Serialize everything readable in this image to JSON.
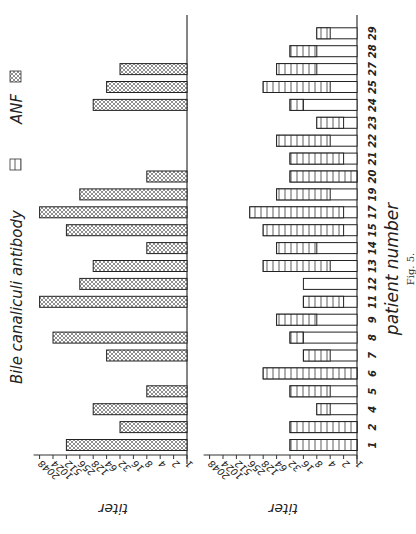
{
  "figure": {
    "caption": "Fig. 5.",
    "orientation": "rotated -90deg",
    "legend": [
      {
        "label": "Bile canaliculi antibody",
        "pattern": "vertical-stripes"
      },
      {
        "label": "ANF",
        "pattern": "cross-hatch"
      }
    ],
    "colors": {
      "ink": "#222222",
      "background": "#ffffff"
    }
  },
  "chart_data": [
    {
      "type": "bar",
      "title": "ANF",
      "xlabel": "patient number",
      "ylabel": "titer",
      "yscale": "log2",
      "ytick_labels": [
        "1",
        "2",
        "4",
        "8",
        "16",
        "32",
        "64",
        "128",
        "256",
        "512",
        "1024",
        "2048"
      ],
      "ylim": [
        1,
        2048
      ],
      "categories": [
        "1",
        "2",
        "4",
        "5",
        "6",
        "7",
        "8",
        "9",
        "11",
        "12",
        "13",
        "14",
        "15",
        "17",
        "19",
        "20",
        "21",
        "22",
        "23",
        "24",
        "25",
        "27",
        "28",
        "29"
      ],
      "values": [
        512,
        32,
        128,
        8,
        null,
        64,
        1024,
        null,
        2048,
        256,
        128,
        8,
        512,
        2048,
        256,
        8,
        null,
        null,
        null,
        128,
        64,
        32,
        null,
        null
      ],
      "grid": false
    },
    {
      "type": "bar",
      "title": "Bile canaliculi antibody",
      "xlabel": "patient number",
      "ylabel": "titer",
      "yscale": "log2",
      "ytick_labels": [
        "1",
        "2",
        "4",
        "8",
        "16",
        "32",
        "64",
        "128",
        "256",
        "512",
        "1024",
        "2048"
      ],
      "ylim": [
        1,
        2048
      ],
      "categories": [
        "1",
        "2",
        "4",
        "5",
        "6",
        "7",
        "8",
        "9",
        "11",
        "12",
        "13",
        "14",
        "15",
        "17",
        "19",
        "20",
        "21",
        "22",
        "23",
        "24",
        "25",
        "27",
        "28",
        "29"
      ],
      "series": [
        {
          "name": "total titer (bar end)",
          "values": [
            32,
            32,
            8,
            32,
            128,
            16,
            32,
            64,
            16,
            16,
            128,
            64,
            128,
            256,
            64,
            32,
            32,
            64,
            8,
            32,
            128,
            64,
            32,
            8
          ]
        },
        {
          "name": "unhatched (plain) portion up to",
          "values": [
            1,
            1,
            4,
            4,
            1,
            4,
            16,
            8,
            2,
            16,
            4,
            8,
            2,
            2,
            4,
            1,
            2,
            4,
            2,
            16,
            4,
            8,
            8,
            4
          ]
        }
      ],
      "grid": false
    }
  ],
  "axis_title": "titer",
  "xaxis_title": "patient number"
}
